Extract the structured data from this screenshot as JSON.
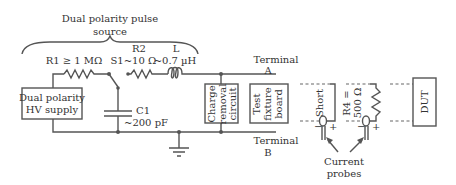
{
  "source_group": {
    "title_line1": "Dual polarity pulse",
    "title_line2": "source"
  },
  "components": {
    "r1": "R1 ≥ 1 MΩ",
    "s1": "S1",
    "r2_name": "R2",
    "r2_value": "~10 Ω",
    "l_name": "L",
    "l_value": "~0.7 µH",
    "c1_name": "C1",
    "c1_value": "~200 pF",
    "r4_line1": "R4 =",
    "r4_line2": "500 Ω"
  },
  "blocks": {
    "hv_supply_line1": "Dual polarity",
    "hv_supply_line2": "HV supply",
    "charge_removal_line1": "Charge",
    "charge_removal_line2": "removal",
    "charge_removal_line3": "circuit",
    "test_fixture_line1": "Test",
    "test_fixture_line2": "fixture",
    "test_fixture_line3": "board",
    "short": "Short",
    "dut": "DUT"
  },
  "terminals": {
    "a_line1": "Terminal",
    "a_line2": "A",
    "b_line1": "Terminal",
    "b_line2": "B"
  },
  "probes": {
    "minus": "−",
    "plus": "+",
    "label_line1": "Current",
    "label_line2": "probes"
  },
  "colors": {
    "line": "#555555",
    "text": "#333333",
    "background": "#ffffff"
  }
}
